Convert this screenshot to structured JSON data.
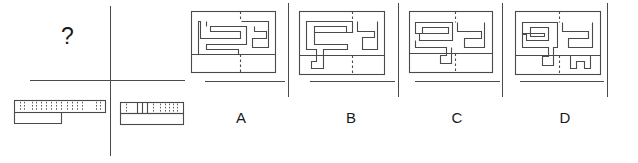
{
  "figure": {
    "type": "visual-reasoning-multiple-choice",
    "width": 638,
    "height": 163,
    "prompt_symbol": "?",
    "stroke_color": "#4a4a4a",
    "text_color": "#1a1a1a",
    "background_color": "#ffffff"
  },
  "prompt": {
    "question_mark": "?",
    "stimuli": [
      {
        "name": "stimulus-left",
        "description": "long flat slab with hatched upper band and stepped lower right edge",
        "x": 14,
        "y": 100,
        "width": 92,
        "height": 24
      },
      {
        "name": "stimulus-right",
        "description": "short slab with hatched upper band divided into segments",
        "x": 120,
        "y": 102,
        "width": 64,
        "height": 23
      }
    ]
  },
  "dividers": {
    "prompt_vertical": {
      "x": 110,
      "y1": 6,
      "y2": 156
    },
    "prompt_horizontal": {
      "x1": 30,
      "x2": 185,
      "y": 80
    },
    "option_verticals": [
      {
        "x": 288,
        "y1": 3,
        "y2": 97
      },
      {
        "x": 398,
        "y1": 3,
        "y2": 97
      },
      {
        "x": 502,
        "y1": 3,
        "y2": 97
      },
      {
        "x": 607,
        "y1": 3,
        "y2": 97
      }
    ],
    "option_baselines": [
      {
        "x1": 205,
        "x2": 285,
        "y": 81
      },
      {
        "x1": 310,
        "x2": 395,
        "y": 81
      },
      {
        "x1": 415,
        "x2": 500,
        "y": 81
      },
      {
        "x1": 520,
        "x2": 604,
        "y": 81
      }
    ]
  },
  "options": [
    {
      "id": "A",
      "label": "A",
      "letter_x": 227,
      "letter_y": 113,
      "box": {
        "x": 191,
        "y": 11,
        "width": 85,
        "height": 62
      },
      "description": "rectangular plan with interlocking S-shaped corridor on the left and hook shape on the right, dashed centre line"
    },
    {
      "id": "B",
      "label": "B",
      "letter_x": 337,
      "letter_y": 113,
      "box": {
        "x": 299,
        "y": 11,
        "width": 86,
        "height": 64
      },
      "description": "rectangular plan with angular comb corridor on the left and bracket shape on the right, notch at bottom, dashed centre line"
    },
    {
      "id": "C",
      "label": "C",
      "letter_x": 443,
      "letter_y": 113,
      "box": {
        "x": 409,
        "y": 11,
        "width": 84,
        "height": 62
      },
      "description": "rectangular plan with double-hook corridor on the left and angular shape on the right, small notch at bottom, dashed centre line"
    },
    {
      "id": "D",
      "label": "D",
      "letter_x": 551,
      "letter_y": 113,
      "box": {
        "x": 515,
        "y": 11,
        "width": 86,
        "height": 64
      },
      "description": "rectangular plan with looping corridor on the left and stepped shape with bottom notch on the right, dashed centre line"
    }
  ]
}
